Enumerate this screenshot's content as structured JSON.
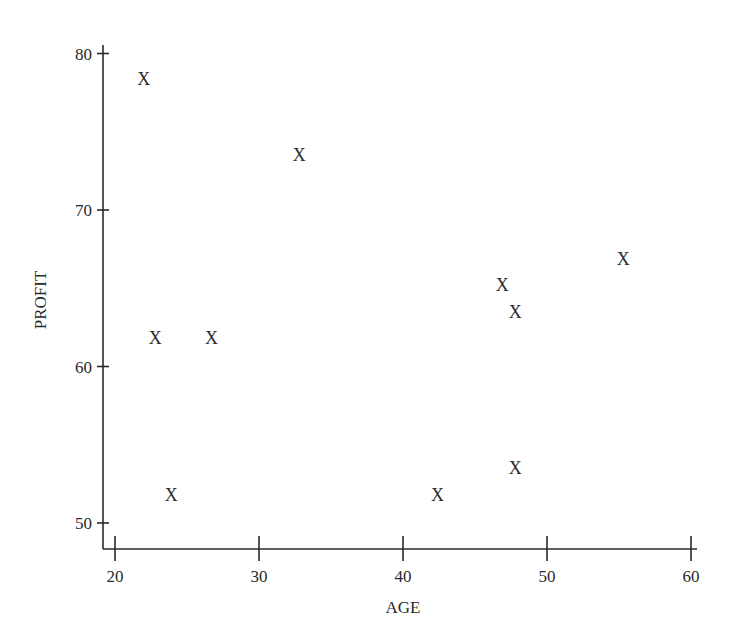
{
  "chart_data": {
    "type": "scatter",
    "title": "",
    "xlabel": "AGE",
    "ylabel": "PROFIT",
    "xlim": [
      20,
      60
    ],
    "ylim": [
      50,
      80
    ],
    "x_ticks": [
      20,
      30,
      40,
      50,
      60
    ],
    "y_ticks": [
      50,
      60,
      70,
      80
    ],
    "grid": false,
    "legend": null,
    "marker": "X",
    "points": [
      {
        "x": 22.0,
        "y": 78.4
      },
      {
        "x": 32.8,
        "y": 73.5
      },
      {
        "x": 22.8,
        "y": 61.8
      },
      {
        "x": 26.7,
        "y": 61.8
      },
      {
        "x": 23.9,
        "y": 51.8
      },
      {
        "x": 42.4,
        "y": 51.8
      },
      {
        "x": 47.8,
        "y": 53.5
      },
      {
        "x": 46.9,
        "y": 65.2
      },
      {
        "x": 47.8,
        "y": 63.5
      },
      {
        "x": 55.3,
        "y": 66.9
      }
    ]
  }
}
